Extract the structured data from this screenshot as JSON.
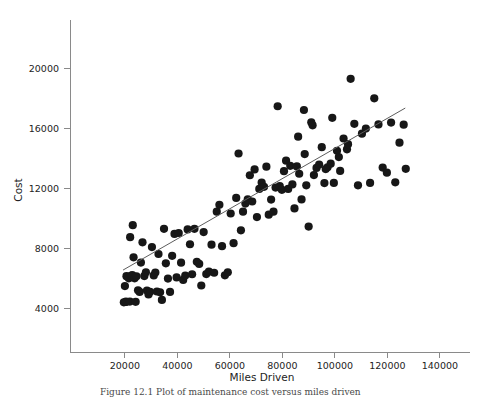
{
  "figure": {
    "caption": "Figure 12.1   Plot of maintenance cost versus miles driven",
    "background_color": "#ffffff",
    "point_color": "#171717",
    "line_color": "#5d5d5d",
    "axis_color": "#8a8a8a"
  },
  "chart_data": {
    "type": "scatter",
    "title": "",
    "xlabel": "Miles Driven",
    "ylabel": "Cost",
    "xlim": [
      0,
      150000
    ],
    "ylim": [
      0,
      22600
    ],
    "grid": false,
    "legend": null,
    "xticks": [
      20000,
      40000,
      60000,
      80000,
      100000,
      120000,
      140000
    ],
    "xticklabels": [
      "20000",
      "40000",
      "60000",
      "80000",
      "100000",
      "120000",
      "140000"
    ],
    "yticks": [
      4000,
      8000,
      12000,
      16000,
      20000
    ],
    "yticklabels": [
      "4000",
      "8000",
      "12000",
      "16000",
      "20000"
    ],
    "trendline": {
      "type": "linear-fit",
      "x_start": 19300,
      "y_start": 6530,
      "x_end": 126800,
      "y_end": 17330,
      "slope": 0.1005,
      "intercept": 4590
    },
    "x": [
      19600,
      20000,
      20400,
      20400,
      20600,
      21100,
      21500,
      21900,
      22000,
      22400,
      22800,
      23000,
      23300,
      23700,
      24100,
      24400,
      25000,
      25600,
      26100,
      26700,
      27400,
      28000,
      28400,
      29000,
      29600,
      30300,
      31000,
      31600,
      32200,
      32800,
      33400,
      34100,
      34900,
      35600,
      36400,
      37200,
      38000,
      38900,
      39700,
      40500,
      41400,
      42200,
      43000,
      43900,
      44800,
      45600,
      46500,
      47400,
      48300,
      49100,
      50000,
      51000,
      52000,
      53000,
      54000,
      55000,
      56000,
      57000,
      58100,
      59200,
      60300,
      61400,
      62400,
      63300,
      64200,
      65000,
      65900,
      66800,
      67600,
      68500,
      69400,
      70300,
      71200,
      72100,
      73000,
      73900,
      74800,
      75700,
      76600,
      77400,
      78200,
      79000,
      79800,
      80600,
      81400,
      82200,
      83000,
      83800,
      84600,
      85500,
      86400,
      87300,
      88200,
      89100,
      90000,
      91000,
      92000,
      93000,
      94000,
      95000,
      96000,
      97200,
      98400,
      99600,
      100800,
      102000,
      103300,
      104600,
      106000,
      107400,
      108800,
      110300,
      111800,
      113400,
      115000,
      116600,
      118200,
      119800,
      121400,
      123000,
      124600,
      126200,
      127000,
      86000,
      88500,
      91500,
      96500,
      99000,
      101500,
      105000
    ],
    "y": [
      4380,
      5460,
      4420,
      4400,
      6120,
      6080,
      5980,
      4430,
      8720,
      6150,
      6200,
      9520,
      7380,
      5980,
      4410,
      6110,
      5180,
      5070,
      7030,
      8380,
      6130,
      6380,
      5160,
      4900,
      5080,
      8060,
      6170,
      6360,
      5100,
      7600,
      5050,
      4540,
      9280,
      6980,
      5960,
      5070,
      7480,
      8940,
      6040,
      9000,
      7020,
      5870,
      6160,
      9240,
      8250,
      6250,
      9280,
      7080,
      6940,
      5500,
      9060,
      6260,
      6420,
      8220,
      6350,
      10420,
      10880,
      8120,
      6180,
      6380,
      10300,
      8320,
      11340,
      14300,
      9180,
      10420,
      10960,
      11240,
      12850,
      11100,
      13240,
      10060,
      11940,
      12360,
      12080,
      13420,
      10220,
      11230,
      10420,
      12030,
      17450,
      12120,
      11880,
      13120,
      13820,
      11940,
      13480,
      12240,
      10640,
      13440,
      12950,
      11240,
      17200,
      12180,
      9430,
      16380,
      12860,
      13340,
      13560,
      14720,
      12330,
      13380,
      13620,
      12340,
      14480,
      13140,
      15300,
      14580,
      19280,
      16280,
      12180,
      15620,
      15960,
      12340,
      17980,
      16240,
      13360,
      13020,
      16360,
      12380,
      15020,
      16220,
      13280,
      15420,
      14260,
      16180,
      13260,
      16680,
      14060,
      14920
    ]
  }
}
